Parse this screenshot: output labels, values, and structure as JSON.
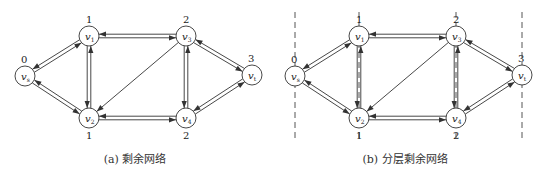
{
  "panels": [
    {
      "id": "a",
      "caption": "(a) 剩余网络",
      "layered": false
    },
    {
      "id": "b",
      "caption": "(b) 分层剩余网络",
      "layered": true
    }
  ],
  "nodes": [
    {
      "id": "vs",
      "label": "v",
      "sub": "s",
      "x": 25,
      "y": 76,
      "layer": "0",
      "layer_pos": "top"
    },
    {
      "id": "v1",
      "label": "v",
      "sub": "1",
      "x": 89,
      "y": 36,
      "layer": "1",
      "layer_pos": "top"
    },
    {
      "id": "v2",
      "label": "v",
      "sub": "2",
      "x": 89,
      "y": 118,
      "layer": "1",
      "layer_pos": "bottom"
    },
    {
      "id": "v3",
      "label": "v",
      "sub": "3",
      "x": 186,
      "y": 36,
      "layer": "2",
      "layer_pos": "top"
    },
    {
      "id": "v4",
      "label": "v",
      "sub": "4",
      "x": 186,
      "y": 118,
      "layer": "2",
      "layer_pos": "bottom"
    },
    {
      "id": "vt",
      "label": "v",
      "sub": "t",
      "x": 252,
      "y": 75,
      "layer": "3",
      "layer_pos": "top"
    }
  ],
  "edges": [
    {
      "from": "vs",
      "to": "v1",
      "double": true
    },
    {
      "from": "vs",
      "to": "v2",
      "double": true
    },
    {
      "from": "v1",
      "to": "v3",
      "double": true
    },
    {
      "from": "v1",
      "to": "v2",
      "double": true
    },
    {
      "from": "v2",
      "to": "v4",
      "double": true
    },
    {
      "from": "v3",
      "to": "v2",
      "double": false
    },
    {
      "from": "v3",
      "to": "v4",
      "double": true
    },
    {
      "from": "v3",
      "to": "vt",
      "double": true
    },
    {
      "from": "v4",
      "to": "vt",
      "double": true
    }
  ],
  "layer_lines_x": [
    25,
    89,
    186,
    252
  ],
  "colors": {
    "stroke": "#333333",
    "node_fill": "#ffffff",
    "dash": "#555555"
  }
}
